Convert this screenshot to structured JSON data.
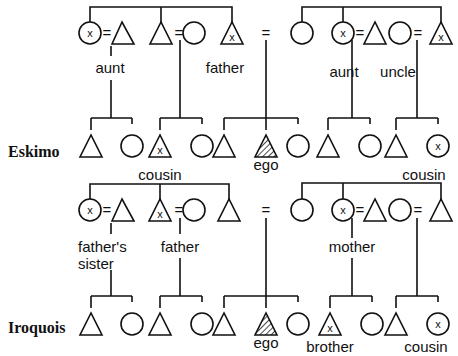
{
  "diagram": {
    "type": "kinship-terminology",
    "systems": [
      {
        "name": "Eskimo",
        "labels": {
          "left_aunt": "aunt",
          "father": "father",
          "right_aunt": "aunt",
          "uncle": "uncle",
          "left_cousin": "cousin",
          "ego": "ego",
          "right_cousin": "cousin"
        }
      },
      {
        "name": "Iroquois",
        "labels": {
          "fathers_sister_1": "father's",
          "fathers_sister_2": "sister",
          "father": "father",
          "mother": "mother",
          "ego": "ego",
          "brother": "brother",
          "cousin": "cousin"
        }
      }
    ],
    "symbols": {
      "marriage": "=",
      "marked": "x"
    }
  }
}
